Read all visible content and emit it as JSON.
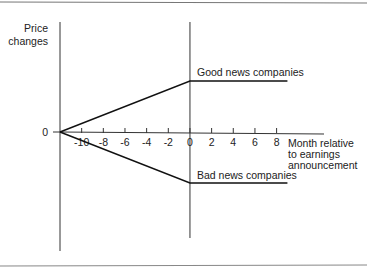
{
  "chart_data": {
    "type": "line",
    "title": "",
    "xlabel": [
      "Month relative",
      "to earnings",
      "announcement"
    ],
    "ylabel": [
      "Price",
      "changes"
    ],
    "y_zero_label": "0",
    "x_ticks": [
      -10,
      -8,
      -6,
      -4,
      -2,
      0,
      2,
      4,
      6,
      8
    ],
    "x_tick_labels": [
      "-10",
      "-8",
      "-6",
      "-4",
      "-2",
      "0",
      "2",
      "4",
      "6",
      "8"
    ],
    "xlim": [
      -12,
      10
    ],
    "ylim": [
      -1.5,
      1.5
    ],
    "series": [
      {
        "name": "Good news companies",
        "points": [
          [
            -12,
            0
          ],
          [
            0,
            0.6
          ],
          [
            9,
            0.6
          ]
        ]
      },
      {
        "name": "Bad news companies",
        "points": [
          [
            -12,
            0
          ],
          [
            0,
            -0.6
          ],
          [
            9,
            -0.6
          ]
        ]
      }
    ],
    "grid": false,
    "legend": "inline-labels"
  }
}
